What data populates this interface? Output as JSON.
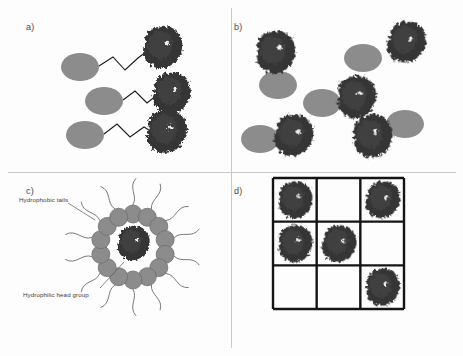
{
  "figure": {
    "width": 463,
    "height": 356,
    "background": "#fdfdfd",
    "divider_color": "#c9c9c9"
  },
  "colors": {
    "protein_dark": "#343434",
    "protein_mid": "#3f3f3f",
    "protein_highlight": "#f2f2f2",
    "head_group_gray": "#8c8c8c",
    "head_group_stroke": "#6f6f6f",
    "linker_line": "#1a1a1a",
    "tail_line": "#6b6b6b",
    "grid_line": "#141414",
    "label_text": "#3c3c3c",
    "panel_label_text": "#4a4a4a"
  },
  "panels": [
    {
      "id": "a",
      "label": "a)",
      "label_x": 26,
      "label_y": 22,
      "description": "Protein conjugated to hydrophilic head group via flexible zigzag linker",
      "units": [
        {
          "ellipse_cx": 80,
          "ellipse_cy": 67,
          "protein_cx": 162,
          "protein_cy": 47,
          "linker": "M 99,66 L 113,57 L 125,70 L 138,58 L 146,52"
        },
        {
          "ellipse_cx": 104,
          "ellipse_cy": 101,
          "protein_cx": 171,
          "protein_cy": 93,
          "linker": "M 123,100 L 135,91 L 147,103 L 157,95"
        },
        {
          "ellipse_cx": 85,
          "ellipse_cy": 135,
          "protein_cx": 166,
          "protein_cy": 131,
          "linker": "M 104,134 L 117,124 L 130,137 L 144,127 L 152,132"
        }
      ]
    },
    {
      "id": "b",
      "label": "b)",
      "label_x": 234,
      "label_y": 22,
      "description": "Dispersed protein and surfactant head groups without covalent linkage",
      "units": [
        {
          "ellipse_cx": 278,
          "ellipse_cy": 85,
          "protein_cx": 275,
          "protein_cy": 52
        },
        {
          "ellipse_cx": 363,
          "ellipse_cy": 58,
          "protein_cx": 406,
          "protein_cy": 42
        },
        {
          "ellipse_cx": 322,
          "ellipse_cy": 103,
          "protein_cx": 356,
          "protein_cy": 97
        },
        {
          "ellipse_cx": 260,
          "ellipse_cy": 139,
          "protein_cx": 293,
          "protein_cy": 135
        },
        {
          "ellipse_cx": 405,
          "ellipse_cy": 124,
          "protein_cx": 372,
          "protein_cy": 136
        }
      ]
    },
    {
      "id": "c",
      "label": "c)",
      "label_x": 26,
      "label_y": 186,
      "description": "Reverse micelle encapsulating a protein; head groups form inner ring with hydrophobic tails outward",
      "micelle": {
        "center_x": 133,
        "center_y": 247,
        "ring_radius": 33,
        "head_radius": 9,
        "head_count": 14,
        "tail_length": 26,
        "protein_cx": 133,
        "protein_cy": 243
      },
      "annotations": [
        {
          "name": "hydrophobic-tails",
          "text": "Hydrophobic  tails",
          "text_x": 19,
          "text_y": 196,
          "leader": "M 68,203 L 95,220"
        },
        {
          "name": "hydrophilic-head-group",
          "text": "Hydrophilic head group",
          "text_x": 23,
          "text_y": 291,
          "leader": "M 100,288 L 124,262"
        }
      ]
    },
    {
      "id": "d",
      "label": "d)",
      "label_x": 234,
      "label_y": 186,
      "description": "Proteins immobilised in a 3 by 3 lattice of compartments",
      "grid": {
        "x": 273,
        "y": 178,
        "width": 131,
        "height": 131,
        "rows": 3,
        "cols": 3,
        "line_width": 2.4,
        "occupancy": [
          [
            1,
            0,
            1
          ],
          [
            1,
            1,
            0
          ],
          [
            0,
            0,
            1
          ]
        ]
      }
    }
  ],
  "dividers": {
    "vertical_x": 231,
    "horizontal_y": 172
  }
}
